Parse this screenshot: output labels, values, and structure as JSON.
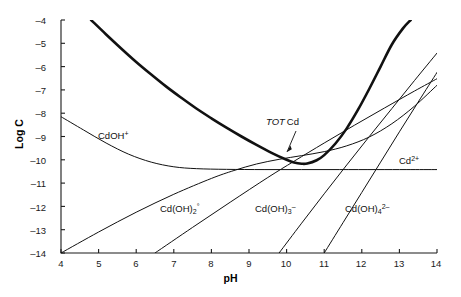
{
  "chart_data": {
    "type": "line",
    "title": "",
    "xlabel": "pH",
    "ylabel": "Log C",
    "xlim": [
      4,
      14
    ],
    "ylim": [
      -14,
      -4
    ],
    "grid": false,
    "legend": "inline-curve-labels",
    "xticks": [
      "4",
      "5",
      "6",
      "7",
      "8",
      "9",
      "10",
      "11",
      "12",
      "13",
      "14"
    ],
    "yticks": [
      "-4",
      "-5",
      "-6",
      "-7",
      "-8",
      "-9",
      "-10",
      "-11",
      "-12",
      "-13",
      "-14"
    ],
    "annotations": [
      {
        "text_parts": {
          "italic": "TOT",
          "roman": "Cd"
        },
        "x": 9.6,
        "y": -9.0,
        "leader": true
      }
    ],
    "series": [
      {
        "name": "TOT Cd",
        "label": "TOT Cd",
        "emphasis": "thick",
        "points": [
          [
            4.8,
            -4.0
          ],
          [
            5.2,
            -4.62
          ],
          [
            5.6,
            -5.22
          ],
          [
            6.0,
            -5.8
          ],
          [
            6.4,
            -6.34
          ],
          [
            6.8,
            -6.86
          ],
          [
            7.2,
            -7.34
          ],
          [
            7.6,
            -7.8
          ],
          [
            8.0,
            -8.22
          ],
          [
            8.4,
            -8.62
          ],
          [
            8.8,
            -9.0
          ],
          [
            9.2,
            -9.36
          ],
          [
            9.6,
            -9.7
          ],
          [
            10.0,
            -10.0
          ],
          [
            10.2,
            -10.12
          ],
          [
            10.4,
            -10.17
          ],
          [
            10.55,
            -10.16
          ],
          [
            10.8,
            -10.02
          ],
          [
            11.0,
            -9.8
          ],
          [
            11.3,
            -9.3
          ],
          [
            11.6,
            -8.65
          ],
          [
            11.9,
            -7.85
          ],
          [
            12.2,
            -6.95
          ],
          [
            12.5,
            -6.0
          ],
          [
            12.8,
            -5.05
          ],
          [
            13.1,
            -4.35
          ],
          [
            13.3,
            -4.0
          ]
        ]
      },
      {
        "name": "CdOH+",
        "label": "CdOH+",
        "emphasis": "thin",
        "points": [
          [
            4.0,
            -8.15
          ],
          [
            4.6,
            -8.72
          ],
          [
            5.2,
            -9.28
          ],
          [
            5.8,
            -9.76
          ],
          [
            6.4,
            -10.1
          ],
          [
            7.0,
            -10.3
          ],
          [
            7.6,
            -10.38
          ],
          [
            8.4,
            -10.41
          ],
          [
            9.4,
            -10.42
          ],
          [
            10.4,
            -10.42
          ],
          [
            11.4,
            -10.42
          ],
          [
            12.4,
            -10.42
          ],
          [
            13.2,
            -10.42
          ],
          [
            14.0,
            -10.42
          ]
        ]
      },
      {
        "name": "Cd2+",
        "label": "Cd2+",
        "emphasis": "thin",
        "points": [
          [
            4.0,
            -14.0
          ],
          [
            5.0,
            -13.1
          ],
          [
            6.0,
            -12.25
          ],
          [
            7.0,
            -11.48
          ],
          [
            8.0,
            -10.8
          ],
          [
            8.6,
            -10.46
          ],
          [
            9.2,
            -10.18
          ],
          [
            9.8,
            -9.98
          ],
          [
            10.4,
            -9.82
          ],
          [
            11.0,
            -9.65
          ],
          [
            11.6,
            -9.4
          ],
          [
            12.2,
            -9.02
          ],
          [
            12.8,
            -8.45
          ],
          [
            13.4,
            -7.7
          ],
          [
            14.0,
            -6.8
          ]
        ]
      },
      {
        "name": "Cd(OH)2o",
        "label": "Cd(OH)2 o",
        "emphasis": "thin",
        "points": [
          [
            6.5,
            -14.0
          ],
          [
            7.5,
            -12.9
          ],
          [
            8.5,
            -11.82
          ],
          [
            9.5,
            -10.76
          ],
          [
            10.2,
            -10.06
          ],
          [
            11.0,
            -9.28
          ],
          [
            11.8,
            -8.52
          ],
          [
            12.6,
            -7.78
          ],
          [
            13.4,
            -7.05
          ],
          [
            14.0,
            -6.52
          ]
        ]
      },
      {
        "name": "Cd(OH)3-",
        "label": "Cd(OH)3 -",
        "emphasis": "thin",
        "points": [
          [
            9.8,
            -14.0
          ],
          [
            10.4,
            -12.72
          ],
          [
            11.0,
            -11.46
          ],
          [
            11.6,
            -10.22
          ],
          [
            12.2,
            -9.0
          ],
          [
            12.8,
            -7.8
          ],
          [
            13.4,
            -6.6
          ],
          [
            14.0,
            -5.42
          ]
        ]
      },
      {
        "name": "Cd(OH)4 2-",
        "label": "Cd(OH)4 2-",
        "emphasis": "thin",
        "points": [
          [
            11.0,
            -14.0
          ],
          [
            11.5,
            -12.7
          ],
          [
            12.0,
            -11.4
          ],
          [
            12.5,
            -10.1
          ],
          [
            13.0,
            -8.8
          ],
          [
            13.5,
            -7.52
          ],
          [
            14.0,
            -6.25
          ]
        ]
      }
    ]
  },
  "axes": {
    "x_title": "pH",
    "y_title": "Log C",
    "x_ticks": [
      "4",
      "5",
      "6",
      "7",
      "8",
      "9",
      "10",
      "11",
      "12",
      "13",
      "14"
    ],
    "y_ticks": [
      "–4",
      "–5",
      "–6",
      "–7",
      "–8",
      "–9",
      "–10",
      "–11",
      "–12",
      "–13",
      "–14"
    ]
  },
  "labels": {
    "cdoh_plus": "CdOH",
    "cdoh_plus_sup": "+",
    "cd2plus": "Cd",
    "cd2plus_sup": "2+",
    "cdoh2": "Cd(OH)",
    "cdoh2_sub": "2",
    "cdoh2_sup": "°",
    "cdoh3": "Cd(OH)",
    "cdoh3_sub": "3",
    "cdoh3_sup": "–",
    "cdoh4": "Cd(OH)",
    "cdoh4_sub": "4",
    "cdoh4_sup": "2–",
    "tot_italic": "TOT",
    "tot_roman": "Cd"
  },
  "colors": {
    "axis": "#1a1a1a",
    "curve": "#111111",
    "background": "#ffffff"
  }
}
